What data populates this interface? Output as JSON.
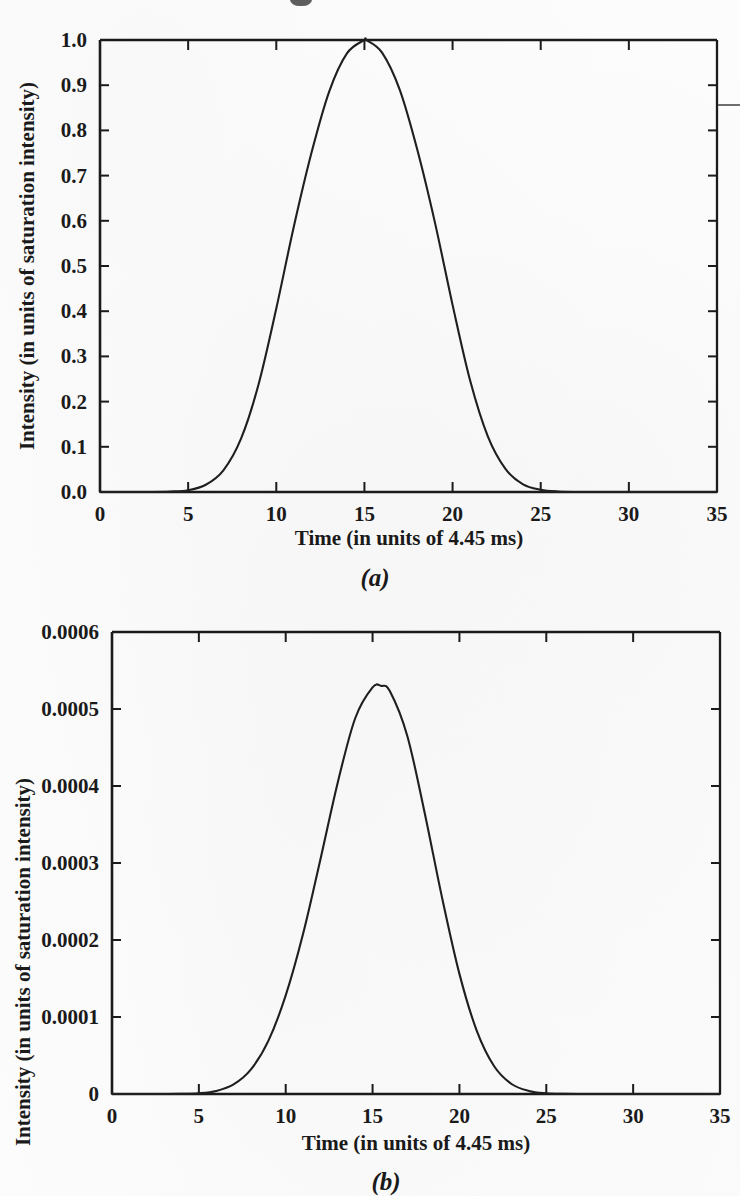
{
  "figure": {
    "shared": {
      "xlabel": "Time (in units of 4.45 ms)",
      "ylabel": "Intensity (in units of saturation intensity)",
      "x_ticks": [
        "0",
        "5",
        "10",
        "15",
        "20",
        "25",
        "30",
        "35"
      ],
      "ink_color": "#1a1a1a",
      "paper_color": "#fdfdfd"
    },
    "panel_a": {
      "caption": "(a)",
      "y_ticks": [
        "0.0",
        "0.1",
        "0.2",
        "0.3",
        "0.4",
        "0.5",
        "0.6",
        "0.7",
        "0.8",
        "0.9",
        "1.0"
      ]
    },
    "panel_b": {
      "caption": "(b)",
      "y_ticks": [
        "0",
        "0.0001",
        "0.0002",
        "0.0003",
        "0.0004",
        "0.0005",
        "0.0006"
      ]
    }
  },
  "chart_data": [
    {
      "id": "panel-a",
      "type": "line",
      "title": "",
      "caption": "(a)",
      "xlabel": "Time (in units of 4.45 ms)",
      "ylabel": "Intensity (in units of saturation intensity)",
      "xlim": [
        0,
        35
      ],
      "ylim": [
        0.0,
        1.0
      ],
      "xticks": [
        0,
        5,
        10,
        15,
        20,
        25,
        30,
        35
      ],
      "yticks": [
        0.0,
        0.1,
        0.2,
        0.3,
        0.4,
        0.5,
        0.6,
        0.7,
        0.8,
        0.9,
        1.0
      ],
      "grid": false,
      "legend": false,
      "peak_x": 15.1,
      "peak_y": 1.0,
      "fwhm": 7.7,
      "series": [
        {
          "name": "pulse intensity",
          "x": [
            0,
            1,
            2,
            3,
            4,
            5,
            6,
            7,
            8,
            9,
            10,
            11,
            12,
            13,
            14,
            15,
            15.1,
            16,
            17,
            18,
            19,
            20,
            21,
            22,
            23,
            24,
            25,
            26,
            27,
            28,
            29,
            30,
            31,
            32,
            33,
            34,
            35
          ],
          "y": [
            0.0,
            0.0,
            0.0,
            0.0,
            0.001,
            0.004,
            0.016,
            0.048,
            0.118,
            0.239,
            0.406,
            0.588,
            0.751,
            0.886,
            0.97,
            1.0,
            1.0,
            0.972,
            0.89,
            0.757,
            0.596,
            0.414,
            0.246,
            0.123,
            0.051,
            0.017,
            0.005,
            0.001,
            0.0,
            0.0,
            0.0,
            0.0,
            0.0,
            0.0,
            0.0,
            0.0,
            0.0
          ]
        }
      ]
    },
    {
      "id": "panel-b",
      "type": "line",
      "title": "",
      "caption": "(b)",
      "xlabel": "Time (in units of 4.45 ms)",
      "ylabel": "Intensity (in units of saturation intensity)",
      "xlim": [
        0,
        35
      ],
      "ylim": [
        0,
        0.0006
      ],
      "xticks": [
        0,
        5,
        10,
        15,
        20,
        25,
        30,
        35
      ],
      "yticks": [
        0,
        0.0001,
        0.0002,
        0.0003,
        0.0004,
        0.0005,
        0.0006
      ],
      "grid": false,
      "legend": false,
      "peak_x": 15.5,
      "peak_y": 0.00053,
      "fwhm": 5.6,
      "series": [
        {
          "name": "pulse intensity",
          "x": [
            0,
            1,
            2,
            3,
            4,
            5,
            6,
            7,
            8,
            9,
            10,
            11,
            12,
            13,
            14,
            15,
            15.5,
            16,
            17,
            18,
            19,
            20,
            21,
            22,
            23,
            24,
            25,
            26,
            27,
            28,
            29,
            30,
            31,
            32,
            33,
            34,
            35
          ],
          "y": [
            0.0,
            0.0,
            0.0,
            0.0,
            2e-07,
            1e-06,
            4e-06,
            1.25e-05,
            3.2e-05,
            6.9e-05,
            0.000128,
            0.000208,
            0.000305,
            0.000405,
            0.000488,
            0.000528,
            0.00053,
            0.000523,
            0.000465,
            0.000365,
            0.000255,
            0.000156,
            8.2e-05,
            3.6e-05,
            1.3e-05,
            4e-06,
            1e-06,
            2e-07,
            0.0,
            0.0,
            0.0,
            0.0,
            0.0,
            0.0,
            0.0,
            0.0,
            0.0
          ]
        }
      ]
    }
  ]
}
